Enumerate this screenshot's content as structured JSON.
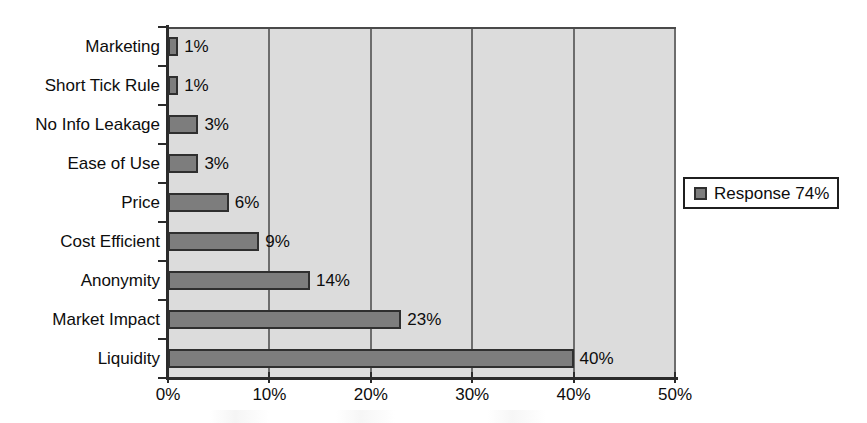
{
  "chart_data": {
    "type": "bar",
    "orientation": "horizontal",
    "title": "",
    "subtitle": "",
    "xlabel": "",
    "ylabel": "",
    "categories": [
      "Marketing",
      "Short Tick Rule",
      "No Info Leakage",
      "Ease of Use",
      "Price",
      "Cost Efficient",
      "Anonymity",
      "Market Impact",
      "Liquidity"
    ],
    "values": [
      1,
      1,
      3,
      3,
      6,
      9,
      14,
      23,
      40
    ],
    "value_labels": [
      "1%",
      "1%",
      "3%",
      "3%",
      "6%",
      "9%",
      "14%",
      "23%",
      "40%"
    ],
    "series": [
      {
        "name": "Response 74%",
        "values": [
          1,
          1,
          3,
          3,
          6,
          9,
          14,
          23,
          40
        ],
        "color": "#7d7d7d"
      }
    ],
    "xlim": [
      0,
      50
    ],
    "x_ticks": [
      0,
      10,
      20,
      30,
      40,
      50
    ],
    "x_tick_labels": [
      "0%",
      "10%",
      "20%",
      "30%",
      "40%",
      "50%"
    ],
    "grid": "vertical",
    "plot_background": "#dcdcdc",
    "bar_color": "#7d7d7d",
    "bar_edge_color": "#2f2f2f",
    "axis_color": "#2b2b2b",
    "gridline_color": "#6d6d6d"
  },
  "legend": {
    "position": "right",
    "entries": [
      {
        "label": "Response 74%",
        "swatch_color": "#7d7d7d"
      }
    ]
  }
}
